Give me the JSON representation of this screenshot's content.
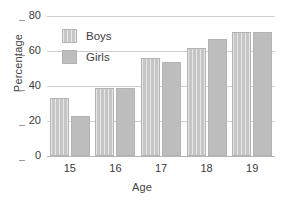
{
  "chart_data": {
    "type": "bar",
    "title": "",
    "xlabel": "Age",
    "ylabel": "Percentage",
    "categories": [
      "15",
      "16",
      "17",
      "18",
      "19"
    ],
    "series": [
      {
        "name": "Boys",
        "color": "#c6c6c6",
        "values": [
          33,
          39,
          56,
          62,
          71
        ]
      },
      {
        "name": "Girls",
        "color": "#bdbdbd",
        "values": [
          23,
          39,
          54,
          67,
          71
        ]
      }
    ],
    "ylim": [
      0,
      80
    ],
    "yticks": [
      0,
      20,
      40,
      60,
      80
    ],
    "ytick_labels": [
      "0",
      "20",
      "40",
      "60",
      "80"
    ],
    "grid": true,
    "legend_position": "upper-left-inside"
  },
  "legend": {
    "items": [
      {
        "label": "Boys"
      },
      {
        "label": "Girls"
      }
    ]
  }
}
